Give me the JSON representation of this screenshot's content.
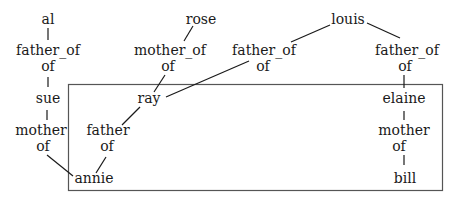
{
  "diagram": {
    "type": "family-relation-graph",
    "nodes": {
      "al": "al",
      "rose": "rose",
      "louis": "louis",
      "sue": "sue",
      "ray": "ray",
      "elaine": "elaine",
      "annie": "annie",
      "bill": "bill"
    },
    "relations": {
      "al_sue": {
        "line1": "father_of",
        "line2": "of"
      },
      "rose_ray": {
        "line1": "mother_of",
        "line2": "of"
      },
      "louis_ray": {
        "line1": "father_of",
        "line2": "of"
      },
      "louis_elaine": {
        "line1": "father_of",
        "line2": "of"
      },
      "sue_annie": {
        "line1": "mother",
        "line2": "of"
      },
      "ray_annie": {
        "line1": "father",
        "line2": "of"
      },
      "elaine_bill": {
        "line1": "mother",
        "line2": "of"
      }
    },
    "edges": [
      [
        "al",
        "father_of",
        "sue"
      ],
      [
        "rose",
        "mother_of",
        "ray"
      ],
      [
        "louis",
        "father_of",
        "ray"
      ],
      [
        "louis",
        "father_of",
        "elaine"
      ],
      [
        "sue",
        "mother_of",
        "annie"
      ],
      [
        "ray",
        "father_of",
        "annie"
      ],
      [
        "elaine",
        "mother_of",
        "bill"
      ]
    ],
    "box_encloses": [
      "ray",
      "elaine",
      "annie",
      "bill",
      "father of (ray→annie)",
      "mother of (elaine→bill)"
    ]
  }
}
